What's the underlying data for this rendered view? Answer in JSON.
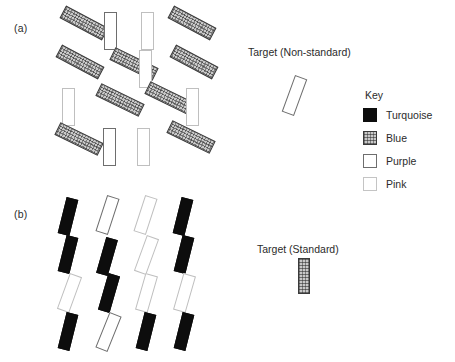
{
  "figure": {
    "panels": [
      {
        "label": "(a)",
        "label_pos": {
          "x": 14,
          "y": 22
        },
        "target_label": "Target (Non-standard)",
        "target_label_pos": {
          "x": 248,
          "y": 46
        },
        "target_item": {
          "color": "purple",
          "x": 288,
          "y": 76,
          "w": 13,
          "h": 39,
          "rot": 20
        },
        "items": [
          {
            "color": "blue",
            "x": 60,
            "y": 16,
            "w": 48,
            "h": 14,
            "rot": 28
          },
          {
            "color": "purple",
            "x": 104,
            "y": 12,
            "w": 13,
            "h": 38,
            "rot": 0
          },
          {
            "color": "pink",
            "x": 141,
            "y": 12,
            "w": 13,
            "h": 38,
            "rot": 0
          },
          {
            "color": "blue",
            "x": 168,
            "y": 16,
            "w": 48,
            "h": 14,
            "rot": 28
          },
          {
            "color": "blue",
            "x": 56,
            "y": 55,
            "w": 48,
            "h": 14,
            "rot": 28
          },
          {
            "color": "blue",
            "x": 110,
            "y": 57,
            "w": 48,
            "h": 14,
            "rot": 26
          },
          {
            "color": "pink",
            "x": 139,
            "y": 50,
            "w": 13,
            "h": 38,
            "rot": 0
          },
          {
            "color": "blue",
            "x": 170,
            "y": 55,
            "w": 48,
            "h": 14,
            "rot": 28
          },
          {
            "color": "pink",
            "x": 62,
            "y": 88,
            "w": 13,
            "h": 38,
            "rot": 0
          },
          {
            "color": "blue",
            "x": 96,
            "y": 93,
            "w": 48,
            "h": 14,
            "rot": 26
          },
          {
            "color": "blue",
            "x": 145,
            "y": 91,
            "w": 48,
            "h": 14,
            "rot": 26
          },
          {
            "color": "pink",
            "x": 186,
            "y": 88,
            "w": 13,
            "h": 38,
            "rot": 0
          },
          {
            "color": "blue",
            "x": 55,
            "y": 132,
            "w": 48,
            "h": 14,
            "rot": 26
          },
          {
            "color": "purple",
            "x": 103,
            "y": 128,
            "w": 13,
            "h": 38,
            "rot": 0
          },
          {
            "color": "pink",
            "x": 137,
            "y": 128,
            "w": 13,
            "h": 38,
            "rot": 0
          },
          {
            "color": "blue",
            "x": 167,
            "y": 130,
            "w": 48,
            "h": 14,
            "rot": 26
          }
        ]
      },
      {
        "label": "(b)",
        "label_pos": {
          "x": 14,
          "y": 208
        },
        "target_label": "Target (Standard)",
        "target_label_pos": {
          "x": 257,
          "y": 243
        },
        "target_item": {
          "color": "blue",
          "x": 298,
          "y": 258,
          "w": 12,
          "h": 36,
          "rot": 0
        },
        "items": [
          {
            "color": "turquoise",
            "x": 62,
            "y": 198,
            "w": 12,
            "h": 37,
            "rot": 14
          },
          {
            "color": "purple",
            "x": 101,
            "y": 196,
            "w": 13,
            "h": 38,
            "rot": 18
          },
          {
            "color": "pink",
            "x": 139,
            "y": 196,
            "w": 13,
            "h": 38,
            "rot": 18
          },
          {
            "color": "turquoise",
            "x": 177,
            "y": 198,
            "w": 12,
            "h": 37,
            "rot": 14
          },
          {
            "color": "turquoise",
            "x": 62,
            "y": 236,
            "w": 12,
            "h": 37,
            "rot": 14
          },
          {
            "color": "turquoise",
            "x": 101,
            "y": 238,
            "w": 12,
            "h": 37,
            "rot": 16
          },
          {
            "color": "pink",
            "x": 140,
            "y": 236,
            "w": 13,
            "h": 38,
            "rot": 20
          },
          {
            "color": "turquoise",
            "x": 178,
            "y": 236,
            "w": 12,
            "h": 37,
            "rot": 14
          },
          {
            "color": "pink",
            "x": 63,
            "y": 274,
            "w": 13,
            "h": 38,
            "rot": 20
          },
          {
            "color": "turquoise",
            "x": 103,
            "y": 274,
            "w": 12,
            "h": 38,
            "rot": 16
          },
          {
            "color": "pink",
            "x": 140,
            "y": 274,
            "w": 13,
            "h": 38,
            "rot": 16
          },
          {
            "color": "pink",
            "x": 178,
            "y": 274,
            "w": 13,
            "h": 38,
            "rot": 16
          },
          {
            "color": "turquoise",
            "x": 62,
            "y": 313,
            "w": 12,
            "h": 37,
            "rot": 14
          },
          {
            "color": "purple",
            "x": 102,
            "y": 313,
            "w": 13,
            "h": 38,
            "rot": 22
          },
          {
            "color": "turquoise",
            "x": 140,
            "y": 313,
            "w": 12,
            "h": 37,
            "rot": 14
          },
          {
            "color": "turquoise",
            "x": 178,
            "y": 313,
            "w": 12,
            "h": 37,
            "rot": 14
          }
        ]
      }
    ],
    "key": {
      "pos": {
        "x": 363,
        "y": 89
      },
      "title": "Key",
      "entries": [
        {
          "swatch": "turquoise",
          "label": "Turquoise"
        },
        {
          "swatch": "blue",
          "label": "Blue"
        },
        {
          "swatch": "purple",
          "label": "Purple"
        },
        {
          "swatch": "pink",
          "label": "Pink"
        }
      ]
    }
  }
}
